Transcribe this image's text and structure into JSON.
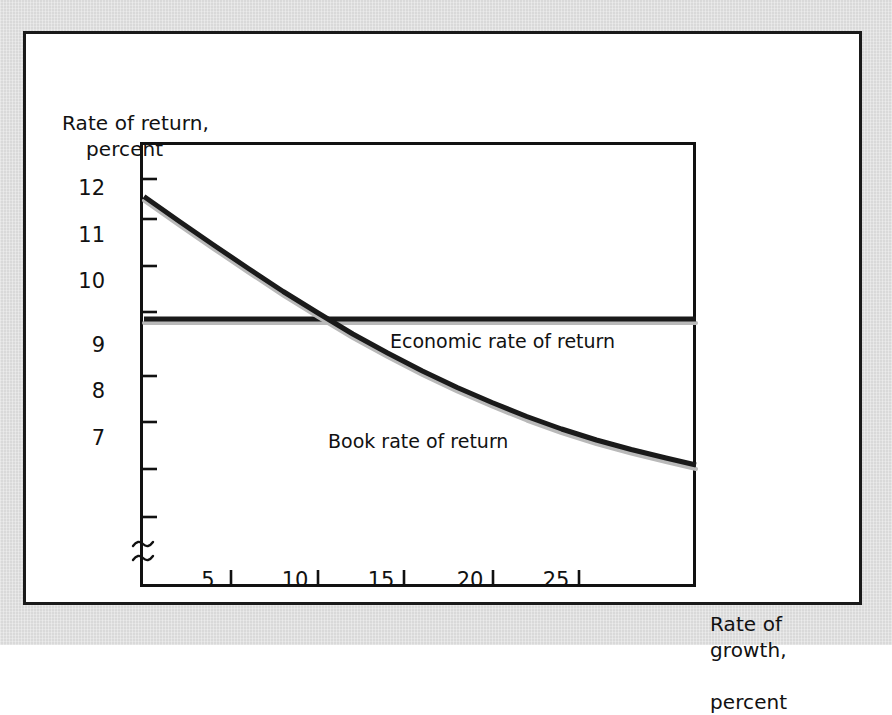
{
  "figure": {
    "background_color": "#d9d9d9",
    "panel_color": "#ffffff",
    "line_color": "#1a1a1a"
  },
  "axes": {
    "y_title": "Rate of return,",
    "y_title_line2": "percent",
    "x_title": "Rate of growth,",
    "x_title_line2": "percent"
  },
  "chart_data": {
    "type": "line",
    "title": "",
    "xlabel": "Rate of growth, percent",
    "ylabel": "Rate of return, percent",
    "xlim": [
      0,
      32
    ],
    "ylim": [
      5.5,
      13.2
    ],
    "grid": false,
    "legend": "none",
    "axis_break": {
      "axis": "y",
      "symbol": "~",
      "note": "y-axis broken below lowest tick"
    },
    "xticks": [
      5,
      10,
      15,
      20,
      25
    ],
    "xtick_labels": [
      "5",
      "10",
      "15",
      "20",
      "25"
    ],
    "xticks_unlabeled": [],
    "yticks": [
      12,
      11,
      10,
      9,
      8,
      7
    ],
    "ytick_labels": [
      "12",
      "11",
      "10",
      "9",
      "8",
      "7"
    ],
    "yticks_unlabeled": [
      13,
      6
    ],
    "series": [
      {
        "name": "Economic rate of return",
        "style": "horizontal-line",
        "color": "#1a1a1a",
        "value": 10,
        "x": [
          0,
          32
        ],
        "values": [
          10,
          10
        ],
        "label": "Economic rate of return",
        "label_x": 14.4,
        "label_y": 9.6
      },
      {
        "name": "Book rate of return",
        "style": "curve",
        "color": "#1a1a1a",
        "label": "Book rate of return",
        "label_x": 11.0,
        "label_y": 7.45,
        "x": [
          0,
          2,
          4,
          6,
          8,
          10,
          12,
          14,
          16,
          18,
          20,
          22,
          24,
          26,
          28,
          30,
          32
        ],
        "values": [
          12.45,
          11.96,
          11.48,
          11.01,
          10.55,
          10.12,
          9.7,
          9.32,
          8.96,
          8.63,
          8.33,
          8.05,
          7.8,
          7.58,
          7.39,
          7.22,
          7.08
        ]
      }
    ],
    "annotations": [
      {
        "text": "Economic rate of return",
        "x": 14.4,
        "y": 9.6
      },
      {
        "text": "Book rate of return",
        "x": 11.0,
        "y": 7.45
      }
    ]
  },
  "ytick_positions_px": [
    185,
    232,
    278,
    342,
    388,
    435
  ],
  "ytick_unlabeled_positions_px": [
    145,
    483
  ],
  "xtick_positions_px": [
    205,
    292,
    378,
    467,
    553
  ]
}
